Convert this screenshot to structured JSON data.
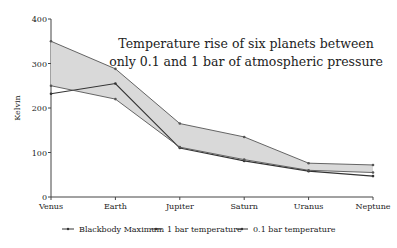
{
  "chart_data": {
    "type": "line",
    "title": "Temperature rise of six planets between only 0.1 and 1 bar of atmospheric pressure",
    "title_lines": [
      "Temperature rise of six planets between",
      "only 0.1 and 1 bar of atmospheric pressure"
    ],
    "xlabel": "",
    "ylabel": "Kelvin",
    "ylim": [
      0,
      400
    ],
    "yticks": [
      0,
      100,
      200,
      300,
      400
    ],
    "categories": [
      "Venus",
      "Earth",
      "Jupiter",
      "Saturn",
      "Uranus",
      "Neptune"
    ],
    "series": [
      {
        "name": "Blackbody Maximum",
        "values": [
          232,
          255,
          110,
          81,
          58,
          47
        ]
      },
      {
        "name": "1 bar temperature",
        "values": [
          350,
          288,
          165,
          135,
          76,
          72
        ]
      },
      {
        "name": "0.1 bar temperature",
        "values": [
          250,
          220,
          112,
          84,
          60,
          55
        ]
      }
    ],
    "shaded_region": "between 0.1 bar and 1 bar temperature",
    "grid": false,
    "legend_position": "bottom"
  }
}
